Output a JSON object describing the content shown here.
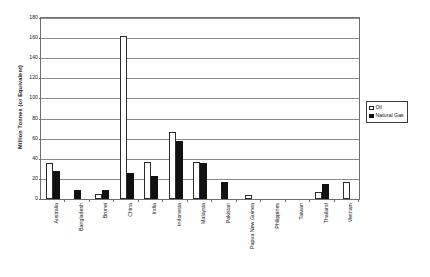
{
  "chart_data": {
    "type": "bar",
    "title": "",
    "xlabel": "",
    "ylabel": "Million Tonnes (or Equivalent)",
    "ylim": [
      0,
      180
    ],
    "ytick_step": 20,
    "yticks": [
      "0",
      "20",
      "40",
      "60",
      "80",
      "100",
      "120",
      "140",
      "160",
      "180"
    ],
    "grid": true,
    "legend_position": "right",
    "categories": [
      "Australia",
      "Bangladesh",
      "Brunei",
      "China",
      "India",
      "Indonesia",
      "Malaysia",
      "Pakistan",
      "Papua New Guinea",
      "Philippines",
      "Taiwan",
      "Thailand",
      "Vietnam"
    ],
    "series": [
      {
        "name": "Oil",
        "color": "#ffffff",
        "values": [
          36,
          0,
          5,
          162,
          37,
          67,
          37,
          0,
          4,
          0,
          0,
          7,
          17
        ]
      },
      {
        "name": "Natural Gas",
        "color": "#111111",
        "values": [
          28,
          9,
          9,
          26,
          23,
          58,
          36,
          17,
          0,
          0,
          0,
          15,
          0
        ]
      }
    ]
  },
  "legend": {
    "items": [
      {
        "label": "Oil",
        "swatch": "oil"
      },
      {
        "label": "Natural Gas",
        "swatch": "gas"
      }
    ]
  }
}
